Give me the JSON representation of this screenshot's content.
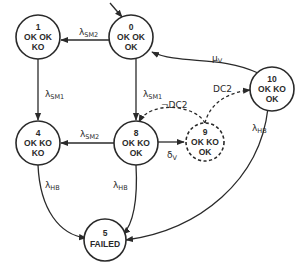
{
  "diagram": {
    "type": "state-transition",
    "colors": {
      "stroke": "#2a2a2a",
      "background": "#ffffff"
    },
    "nodes": [
      {
        "id": "0",
        "line1": "OK OK",
        "line2": "OK",
        "style": "solid",
        "initial": true
      },
      {
        "id": "1",
        "line1": "OK OK",
        "line2": "KO",
        "style": "solid"
      },
      {
        "id": "4",
        "line1": "OK KO",
        "line2": "KO",
        "style": "solid"
      },
      {
        "id": "8",
        "line1": "OK KO",
        "line2": "OK",
        "style": "solid"
      },
      {
        "id": "9",
        "line1": "OK KO",
        "line2": "OK",
        "style": "dashed"
      },
      {
        "id": "10",
        "line1": "OK KO",
        "line2": "OK",
        "style": "solid"
      },
      {
        "id": "5",
        "line1": "FAILED",
        "line2": "",
        "style": "solid"
      }
    ],
    "edges": [
      {
        "from": "0",
        "to": "1",
        "label": "λ",
        "sub": "SM2",
        "style": "solid"
      },
      {
        "from": "0",
        "to": "8",
        "label": "λ",
        "sub": "SM1",
        "style": "solid"
      },
      {
        "from": "1",
        "to": "4",
        "label": "λ",
        "sub": "SM1",
        "style": "solid"
      },
      {
        "from": "8",
        "to": "4",
        "label": "λ",
        "sub": "SM2",
        "style": "solid"
      },
      {
        "from": "8",
        "to": "9",
        "label": "δ",
        "sub": "V",
        "style": "solid"
      },
      {
        "from": "9",
        "to": "8",
        "label": "¬DC2",
        "sub": "",
        "style": "dashed"
      },
      {
        "from": "9",
        "to": "10",
        "label": "DC2",
        "sub": "",
        "style": "dashed"
      },
      {
        "from": "10",
        "to": "0",
        "label": "μ",
        "sub": "V",
        "style": "solid"
      },
      {
        "from": "4",
        "to": "5",
        "label": "λ",
        "sub": "HB",
        "style": "solid"
      },
      {
        "from": "8",
        "to": "5",
        "label": "λ",
        "sub": "HB",
        "style": "solid"
      },
      {
        "from": "10",
        "to": "5",
        "label": "λ",
        "sub": "HB",
        "style": "solid"
      }
    ]
  }
}
